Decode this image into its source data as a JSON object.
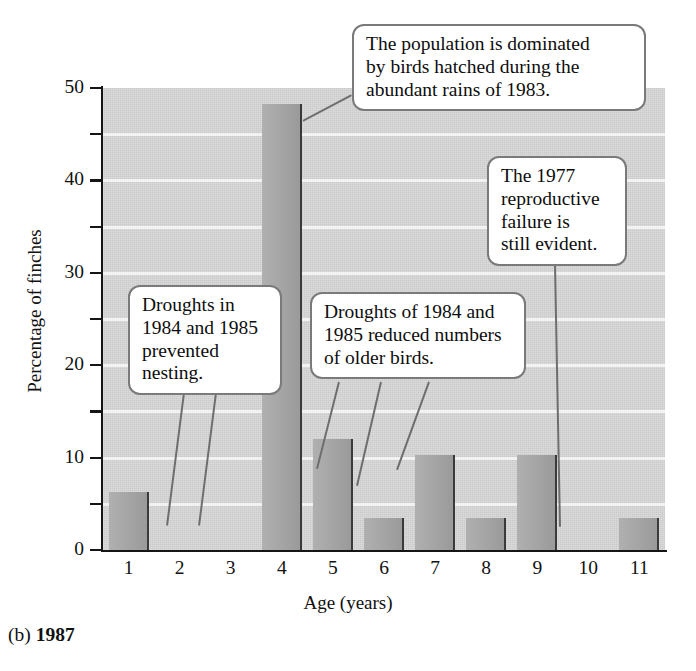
{
  "figure": {
    "caption_prefix": "(b) ",
    "caption_year": "1987"
  },
  "chart_data": {
    "type": "bar",
    "title": "",
    "xlabel": "Age (years)",
    "ylabel": "Percentage of finches",
    "categories": [
      "1",
      "2",
      "3",
      "4",
      "5",
      "6",
      "7",
      "8",
      "9",
      "10",
      "11"
    ],
    "values": [
      6.3,
      0,
      0,
      48.3,
      12.0,
      3.5,
      10.3,
      3.5,
      10.3,
      0,
      3.5
    ],
    "ylim": [
      0,
      50
    ],
    "y_major_ticks": [
      0,
      10,
      20,
      30,
      40,
      50
    ],
    "y_minor_ticks": [
      5,
      15,
      25,
      35,
      45
    ],
    "y_tick_labels": [
      "0",
      "10",
      "20",
      "30",
      "40",
      "50"
    ],
    "grid": "horizontal-white-gridlines",
    "legend": "none",
    "bar_color": "#a4a4a4",
    "plot_background": "#d7d7d7",
    "annotations": [
      {
        "id": "annotation-population-dominated",
        "text": "The population is dominated by birds hatched during the abundant rains of 1983.",
        "points_to_category": "4"
      },
      {
        "id": "annotation-1977-failure",
        "text": "The 1977 reproductive failure is still evident.",
        "points_to_category": "10"
      },
      {
        "id": "annotation-droughts-prevented-nesting",
        "text": "Droughts in 1984 and 1985 prevented nesting.",
        "points_to_category": "2, 3"
      },
      {
        "id": "annotation-droughts-reduced-older",
        "text": "Droughts of 1984 and 1985 reduced numbers of older birds.",
        "points_to_category": "6, 8, 9"
      }
    ]
  },
  "annotations_text": {
    "population": {
      "line1": "The population is dominated",
      "line2": "by birds hatched during the",
      "line3": "abundant rains of 1983."
    },
    "failure1977": {
      "line1": "The 1977",
      "line2": "reproductive",
      "line3": "failure is",
      "line4": "still evident."
    },
    "nesting": {
      "line1": "Droughts in",
      "line2": "1984 and 1985",
      "line3": "prevented",
      "line4": "nesting."
    },
    "olderbirds": {
      "line1": "Droughts of 1984 and",
      "line2": "1985 reduced numbers",
      "line3": "of older birds."
    }
  }
}
